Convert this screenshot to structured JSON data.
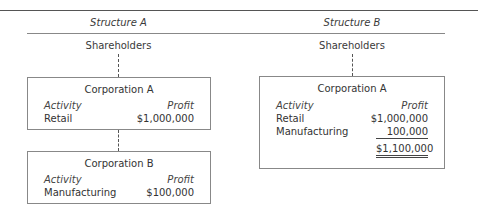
{
  "structure_a": {
    "heading": "Structure A",
    "top_node": "Shareholders",
    "corporation_a": {
      "title": "Corporation A",
      "activity_header": "Activity",
      "profit_header": "Profit",
      "rows": [
        {
          "activity": "Retail",
          "profit": "$1,000,000"
        }
      ]
    },
    "corporation_b": {
      "title": "Corporation B",
      "activity_header": "Activity",
      "profit_header": "Profit",
      "rows": [
        {
          "activity": "Manufacturing",
          "profit": "$100,000"
        }
      ]
    }
  },
  "structure_b": {
    "heading": "Structure B",
    "top_node": "Shareholders",
    "corporation_a": {
      "title": "Corporation A",
      "activity_header": "Activity",
      "profit_header": "Profit",
      "rows": [
        {
          "activity": "Retail",
          "profit": "$1,000,000"
        },
        {
          "activity": "Manufacturing",
          "profit": "100,000"
        }
      ],
      "total": "$1,100,000"
    }
  }
}
